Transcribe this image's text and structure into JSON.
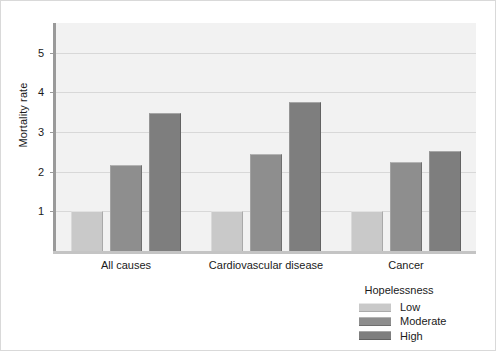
{
  "chart_data": {
    "type": "bar",
    "title": "",
    "xlabel": "",
    "ylabel": "Mortality rate",
    "categories": [
      "All causes",
      "Cardiovascular disease",
      "Cancer"
    ],
    "series": [
      {
        "name": "Low",
        "values": [
          1.0,
          1.0,
          1.0
        ],
        "color": "#c9c9c9"
      },
      {
        "name": "Moderate",
        "values": [
          2.18,
          2.45,
          2.25
        ],
        "color": "#8e8e8e"
      },
      {
        "name": "High",
        "values": [
          3.47,
          3.77,
          2.52
        ],
        "color": "#7e7e7e"
      }
    ],
    "ylim": [
      0,
      5.75
    ],
    "yticks": [
      1,
      2,
      3,
      4,
      5
    ],
    "ytick_labels": [
      "1",
      "2",
      "3",
      "4",
      "5"
    ],
    "grid": true,
    "legend": {
      "title": "Hopelessness",
      "position": "bottom-right",
      "entries": [
        "Low",
        "Moderate",
        "High"
      ]
    },
    "plot_background": "#f2f2f2",
    "figure_background": "#ffffff"
  }
}
